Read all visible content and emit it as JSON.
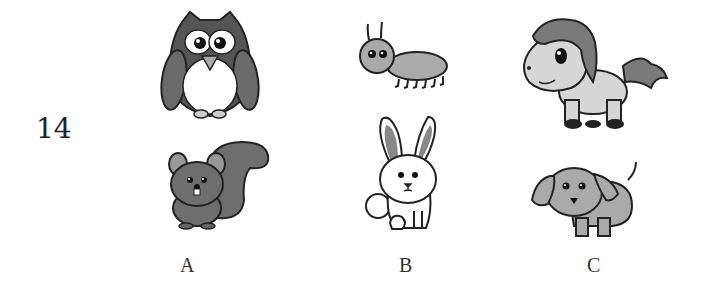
{
  "question": {
    "number": "14"
  },
  "options": [
    {
      "label": "A",
      "animals": [
        "owl",
        "squirrel"
      ]
    },
    {
      "label": "B",
      "animals": [
        "ant",
        "rabbit"
      ]
    },
    {
      "label": "C",
      "animals": [
        "pony",
        "puppy"
      ]
    }
  ],
  "colors": {
    "outline": "#222222",
    "dark_gray": "#555555",
    "mid_gray": "#8a8a8a",
    "light_gray": "#a8a8a8",
    "pale_gray": "#d4d4d4",
    "background": "#ffffff"
  }
}
